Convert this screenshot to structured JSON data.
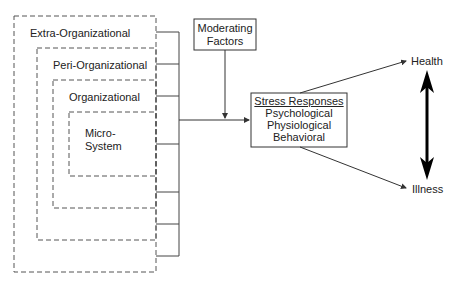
{
  "levels": [
    {
      "label": "Extra-Organizational"
    },
    {
      "label": "Peri-Organizational"
    },
    {
      "label": "Organizational"
    },
    {
      "label": "Micro-\nSystem",
      "line1": "Micro-",
      "line2": "System"
    }
  ],
  "moderating": {
    "line1": "Moderating",
    "line2": "Factors"
  },
  "stress": {
    "title": "Stress Responses",
    "items": [
      "Psychological",
      "Physiological",
      "Behavioral"
    ]
  },
  "outcomes": {
    "top": "Health",
    "bottom": "Illness"
  },
  "colors": {
    "line": "#333333",
    "text": "#222222",
    "background": "#ffffff"
  }
}
